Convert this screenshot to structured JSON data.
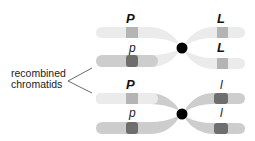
{
  "diagram": {
    "annotation": {
      "line1": "recombined",
      "line2": "chromatids"
    },
    "colors": {
      "light_chromatid": "#ebebeb",
      "medium_chromatid": "#cdcdcd",
      "light_band": "#b4b4b4",
      "dark_band": "#6e6e6e",
      "centromere": "#000000",
      "text": "#222222"
    },
    "chromosomes": [
      {
        "name": "top-chromosome",
        "chromatids": [
          {
            "position": "upper",
            "left_allele": "P",
            "right_allele": "L"
          },
          {
            "position": "lower",
            "left_allele": "p",
            "right_allele": "L"
          }
        ]
      },
      {
        "name": "bottom-chromosome",
        "chromatids": [
          {
            "position": "upper",
            "left_allele": "P",
            "right_allele": "l"
          },
          {
            "position": "lower",
            "left_allele": "p",
            "right_allele": "l"
          }
        ]
      }
    ],
    "labels": {
      "top_upper_left": "P",
      "top_upper_right": "L",
      "top_lower_left": "p",
      "top_lower_right": "L",
      "bottom_upper_left": "P",
      "bottom_upper_right": "l",
      "bottom_lower_left": "p",
      "bottom_lower_right": "l"
    }
  }
}
